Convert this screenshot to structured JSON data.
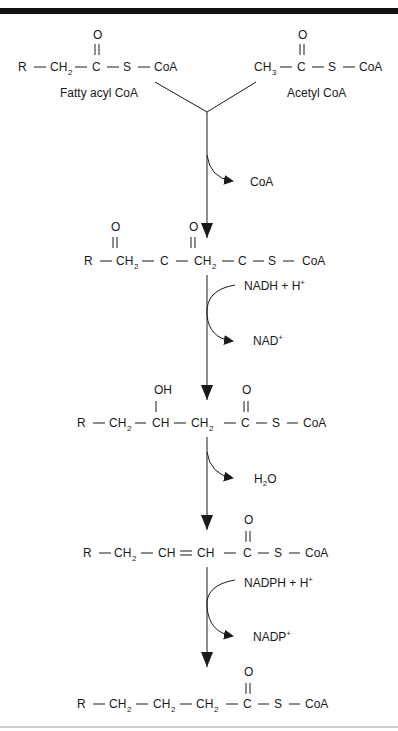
{
  "diagram": {
    "title_bar": "",
    "reactants": {
      "fatty_acyl_coa": {
        "label": "Fatty acyl CoA",
        "formula": [
          "R",
          "CH",
          "2",
          "C",
          "S",
          "CoA"
        ],
        "carbonyl_o": "O"
      },
      "acetyl_coa": {
        "label": "Acetyl CoA",
        "formula": [
          "CH",
          "3",
          "C",
          "S",
          "CoA"
        ],
        "carbonyl_o": "O"
      }
    },
    "steps": [
      {
        "released": "CoA"
      },
      {
        "input": "NADH + H",
        "input_sup": "+",
        "output": "NAD",
        "output_sup": "+"
      },
      {
        "released_main": "H",
        "released_sub": "2",
        "released_tail": "O"
      },
      {
        "input": "NADPH + H",
        "input_sup": "+",
        "output": "NADP",
        "output_sup": "+"
      }
    ],
    "intermediates": [
      {
        "name": "3-ketoacyl CoA",
        "atoms": [
          "R",
          "CH",
          "2",
          "C",
          "CH",
          "2",
          "C",
          "S",
          "CoA"
        ],
        "substituents": [
          "O",
          "O"
        ]
      },
      {
        "name": "3-hydroxyacyl CoA",
        "atoms": [
          "R",
          "CH",
          "2",
          "CH",
          "CH",
          "2",
          "C",
          "S",
          "CoA"
        ],
        "substituents": [
          "OH",
          "O"
        ]
      },
      {
        "name": "trans-2-enoyl CoA",
        "atoms": [
          "R",
          "CH",
          "2",
          "CH",
          "CH",
          "C",
          "S",
          "CoA"
        ],
        "substituents": [
          "O"
        ]
      },
      {
        "name": "elongated acyl CoA",
        "atoms": [
          "R",
          "CH",
          "2",
          "CH",
          "2",
          "CH",
          "2",
          "C",
          "S",
          "CoA"
        ],
        "substituents": [
          "O"
        ]
      }
    ],
    "colors": {
      "ink": "#1a1a1a",
      "bar": "#111111",
      "rule": "#9a9a9a",
      "background": "#ffffff"
    }
  }
}
